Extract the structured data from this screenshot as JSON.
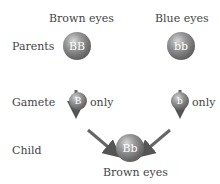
{
  "diagram": {
    "parents": {
      "left": {
        "phenotype": "Brown eyes",
        "genotype": "BB"
      },
      "right": {
        "phenotype": "Blue eyes",
        "genotype": "bb"
      }
    },
    "gametes": {
      "left": {
        "allele": "B",
        "note": "only"
      },
      "right": {
        "allele": "b",
        "note": "only"
      }
    },
    "child": {
      "genotype": "Bb",
      "phenotype": "Brown eyes"
    },
    "row_labels": {
      "parents": "Parents",
      "gamete": "Gamete",
      "child": "Child"
    }
  },
  "colors": {
    "sphere": "#6a6a6a",
    "arrow": "#555555",
    "text": "#444444"
  }
}
